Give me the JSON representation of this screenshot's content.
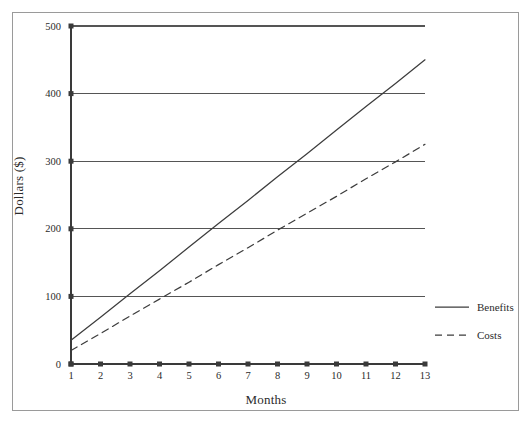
{
  "chart_data": {
    "type": "line",
    "title": "",
    "subtitle": "",
    "xlabel": "Months",
    "ylabel": "Dollars ($)",
    "x": [
      1,
      2,
      3,
      4,
      5,
      6,
      7,
      8,
      9,
      10,
      11,
      12,
      13
    ],
    "xlim": [
      1,
      13
    ],
    "ylim": [
      0,
      500
    ],
    "xticks": [
      "1",
      "2",
      "3",
      "4",
      "5",
      "6",
      "7",
      "8",
      "9",
      "10",
      "11",
      "12",
      "13"
    ],
    "yticks": [
      "0",
      "100",
      "200",
      "300",
      "400",
      "500"
    ],
    "grid": "horizontal",
    "legend_position": "right",
    "series": [
      {
        "name": "Benefits",
        "style": "solid",
        "color": "#3d3d3d",
        "values": [
          35,
          69,
          104,
          138,
          173,
          208,
          242,
          277,
          311,
          346,
          381,
          415,
          450
        ]
      },
      {
        "name": "Costs",
        "style": "dashed",
        "color": "#3d3d3d",
        "values": [
          20,
          45,
          71,
          96,
          121,
          147,
          172,
          198,
          223,
          248,
          274,
          299,
          325
        ]
      }
    ],
    "annotations": []
  },
  "legend": {
    "items": [
      {
        "label": "Benefits",
        "style": "solid"
      },
      {
        "label": "Costs",
        "style": "dashed"
      }
    ]
  },
  "axes": {
    "x_title": "Months",
    "y_title": "Dollars ($)"
  },
  "colors": {
    "line": "#3d3d3d",
    "grid": "#555555",
    "axis": "#3a3a3a",
    "frame": "#9a9a9a",
    "background": "#ffffff"
  }
}
